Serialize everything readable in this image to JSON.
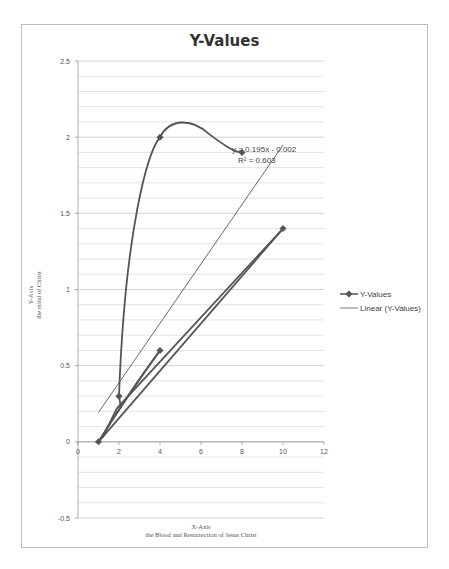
{
  "chart_data": {
    "type": "scatter",
    "title": "Y-Values",
    "xlabel": "X-Axis",
    "xlabel_sub": "the Blood and Resurrection of Jesus Christ",
    "ylabel": "Y-Axis",
    "ylabel_sub": "the mind of Christ",
    "xlim": [
      0,
      12
    ],
    "ylim": [
      -0.5,
      2.5
    ],
    "x_ticks": [
      "0",
      "2",
      "4",
      "6",
      "8",
      "10",
      "12"
    ],
    "y_ticks": [
      "-0.5",
      "0",
      "0.5",
      "1",
      "1.5",
      "2",
      "2.5"
    ],
    "grid": true,
    "legend_position": "right",
    "series": [
      {
        "name": "Y-Values",
        "style": "smoothed line with diamond markers",
        "points": [
          [
            1,
            0
          ],
          [
            10,
            1.4
          ],
          [
            2,
            0.25
          ],
          [
            1,
            0
          ],
          [
            4,
            0.6
          ],
          [
            1,
            0
          ],
          [
            2,
            0.3
          ],
          [
            4,
            2
          ],
          [
            8,
            1.9
          ]
        ]
      },
      {
        "name": "Linear (Y-Values)",
        "style": "thin trendline",
        "equation": "y = 0.195x - 0.002",
        "r_squared": "R² = 0.603",
        "x_range": [
          1,
          10
        ]
      }
    ]
  },
  "legend": {
    "items": [
      "Y-Values",
      "Linear (Y-Values)"
    ]
  },
  "annotations": {
    "equation": "y = 0.195x - 0.002",
    "r2": "R² = 0.603"
  }
}
